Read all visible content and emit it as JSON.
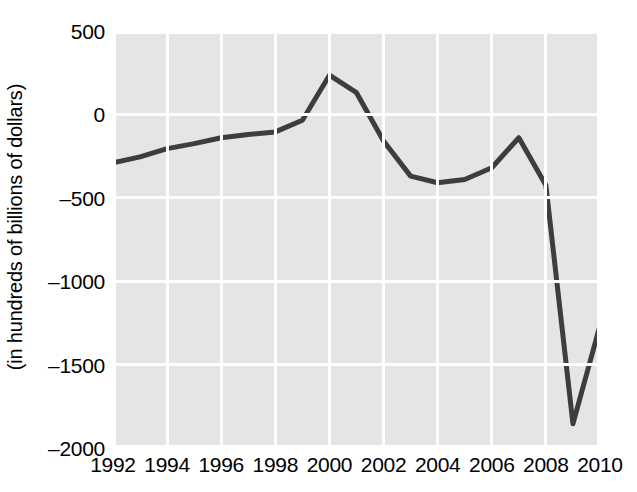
{
  "chart_data": {
    "type": "line",
    "title": "",
    "xlabel": "",
    "ylabel": "(in hundreds of billions of dollars)",
    "x": [
      1992,
      1993,
      1994,
      1995,
      1996,
      1997,
      1998,
      1999,
      2000,
      2001,
      2002,
      2003,
      2004,
      2005,
      2006,
      2007,
      2008,
      2009,
      2010
    ],
    "values": [
      -290,
      -255,
      -205,
      -175,
      -140,
      -120,
      -105,
      -35,
      235,
      130,
      -160,
      -370,
      -410,
      -390,
      -320,
      -140,
      -425,
      -1855,
      -1265
    ],
    "series": [
      {
        "name": "federal budget surplus/deficit",
        "values": [
          -290,
          -255,
          -205,
          -175,
          -140,
          -120,
          -105,
          -35,
          235,
          130,
          -160,
          -370,
          -410,
          -390,
          -320,
          -140,
          -425,
          -1855,
          -1265
        ]
      }
    ],
    "xlim": [
      1992,
      2010
    ],
    "ylim": [
      -2000,
      500
    ],
    "xticks": [
      1992,
      1994,
      1996,
      1998,
      2000,
      2002,
      2004,
      2006,
      2008,
      2010
    ],
    "xtick_labels": [
      "1992",
      "1994",
      "1996",
      "1998",
      "2000",
      "2002",
      "2004",
      "2006",
      "2008",
      "2010"
    ],
    "yticks": [
      500,
      0,
      -500,
      -1000,
      -1500,
      -2000
    ],
    "ytick_labels": [
      "500",
      "0",
      "–500",
      "–1000",
      "–1500",
      "–2000"
    ],
    "grid": true,
    "legend": "none",
    "colors": {
      "plot_background": "#e5e5e5",
      "gridline": "#ffffff",
      "line": "#3d3d3d",
      "text": "#000000",
      "figure_background": "#ffffff"
    },
    "line_width_px": 5
  }
}
